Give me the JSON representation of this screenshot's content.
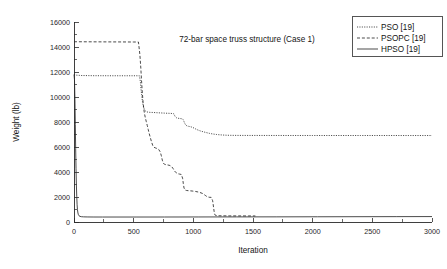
{
  "chart_data": {
    "type": "line",
    "title": "72-bar space truss structure (Case 1)",
    "xlabel": "Iteration",
    "ylabel": "Weight (lb)",
    "xlim": [
      0,
      3000
    ],
    "ylim": [
      0,
      16000
    ],
    "xticks": [
      0,
      500,
      1000,
      1500,
      2000,
      2500,
      3000
    ],
    "yticks": [
      0,
      2000,
      4000,
      6000,
      8000,
      10000,
      12000,
      14000,
      16000
    ],
    "xtick_labels": [
      "0",
      "500",
      "1000",
      "1500",
      "2000",
      "2500",
      "3000"
    ],
    "ytick_labels": [
      "0",
      "2000",
      "4000",
      "6000",
      "8000",
      "10000",
      "12000",
      "14000",
      "16000"
    ],
    "grid": false,
    "legend_position": "top-right",
    "series": [
      {
        "name": "PSO [19]",
        "style": "dash-dot",
        "color": "#2b2b2b",
        "points": [
          [
            0,
            11800
          ],
          [
            8,
            11780
          ],
          [
            20,
            11750
          ],
          [
            60,
            11720
          ],
          [
            160,
            11705
          ],
          [
            300,
            11700
          ],
          [
            430,
            11700
          ],
          [
            520,
            11700
          ],
          [
            548,
            11695
          ],
          [
            556,
            11250
          ],
          [
            562,
            10600
          ],
          [
            568,
            10050
          ],
          [
            574,
            9620
          ],
          [
            580,
            9300
          ],
          [
            588,
            9060
          ],
          [
            596,
            8900
          ],
          [
            606,
            8820
          ],
          [
            620,
            8790
          ],
          [
            640,
            8770
          ],
          [
            668,
            8760
          ],
          [
            700,
            8740
          ],
          [
            740,
            8720
          ],
          [
            780,
            8700
          ],
          [
            812,
            8690
          ],
          [
            836,
            8660
          ],
          [
            848,
            8430
          ],
          [
            860,
            8330
          ],
          [
            872,
            8300
          ],
          [
            888,
            8280
          ],
          [
            902,
            8260
          ],
          [
            916,
            8180
          ],
          [
            926,
            7930
          ],
          [
            936,
            7760
          ],
          [
            948,
            7680
          ],
          [
            962,
            7650
          ],
          [
            978,
            7620
          ],
          [
            996,
            7560
          ],
          [
            1012,
            7480
          ],
          [
            1028,
            7400
          ],
          [
            1046,
            7330
          ],
          [
            1064,
            7270
          ],
          [
            1086,
            7210
          ],
          [
            1110,
            7150
          ],
          [
            1136,
            7090
          ],
          [
            1164,
            7040
          ],
          [
            1196,
            7000
          ],
          [
            1228,
            6970
          ],
          [
            1262,
            6950
          ],
          [
            1300,
            6935
          ],
          [
            1360,
            6928
          ],
          [
            1460,
            6925
          ],
          [
            1700,
            6922
          ],
          [
            2000,
            6920
          ],
          [
            2400,
            6920
          ],
          [
            2800,
            6918
          ],
          [
            3000,
            6918
          ]
        ]
      },
      {
        "name": "PSOPC [19]",
        "style": "dashed",
        "color": "#2b2b2b",
        "points": [
          [
            0,
            14420
          ],
          [
            40,
            14420
          ],
          [
            120,
            14415
          ],
          [
            260,
            14410
          ],
          [
            400,
            14405
          ],
          [
            500,
            14400
          ],
          [
            540,
            14400
          ],
          [
            552,
            13400
          ],
          [
            560,
            12300
          ],
          [
            566,
            11300
          ],
          [
            572,
            10400
          ],
          [
            578,
            9700
          ],
          [
            584,
            9100
          ],
          [
            590,
            8700
          ],
          [
            598,
            8330
          ],
          [
            606,
            8020
          ],
          [
            614,
            7720
          ],
          [
            622,
            7400
          ],
          [
            630,
            7080
          ],
          [
            640,
            6740
          ],
          [
            650,
            6400
          ],
          [
            660,
            6120
          ],
          [
            670,
            5980
          ],
          [
            682,
            5930
          ],
          [
            696,
            5880
          ],
          [
            710,
            5800
          ],
          [
            722,
            5620
          ],
          [
            732,
            5300
          ],
          [
            740,
            4950
          ],
          [
            748,
            4720
          ],
          [
            758,
            4620
          ],
          [
            772,
            4580
          ],
          [
            788,
            4560
          ],
          [
            804,
            4520
          ],
          [
            818,
            4440
          ],
          [
            830,
            4280
          ],
          [
            842,
            4090
          ],
          [
            856,
            3940
          ],
          [
            870,
            3860
          ],
          [
            886,
            3830
          ],
          [
            900,
            3800
          ],
          [
            910,
            3500
          ],
          [
            916,
            3080
          ],
          [
            922,
            2720
          ],
          [
            930,
            2560
          ],
          [
            944,
            2520
          ],
          [
            964,
            2500
          ],
          [
            990,
            2480
          ],
          [
            1020,
            2440
          ],
          [
            1050,
            2380
          ],
          [
            1078,
            2280
          ],
          [
            1100,
            2130
          ],
          [
            1116,
            2020
          ],
          [
            1132,
            1980
          ],
          [
            1150,
            1970
          ],
          [
            1162,
            1700
          ],
          [
            1168,
            1280
          ],
          [
            1174,
            860
          ],
          [
            1180,
            580
          ],
          [
            1190,
            520
          ],
          [
            1210,
            500
          ],
          [
            1250,
            495
          ],
          [
            1300,
            490
          ],
          [
            1380,
            488
          ],
          [
            1460,
            486
          ],
          [
            1520,
            485
          ]
        ]
      },
      {
        "name": "HPSO [19]",
        "style": "solid",
        "color": "#2b2b2b",
        "points": [
          [
            0,
            11800
          ],
          [
            4,
            11400
          ],
          [
            8,
            9800
          ],
          [
            11,
            7800
          ],
          [
            14,
            5900
          ],
          [
            17,
            4300
          ],
          [
            20,
            3000
          ],
          [
            23,
            2050
          ],
          [
            26,
            1380
          ],
          [
            29,
            980
          ],
          [
            33,
            720
          ],
          [
            37,
            580
          ],
          [
            42,
            500
          ],
          [
            50,
            450
          ],
          [
            62,
            425
          ],
          [
            80,
            412
          ],
          [
            110,
            405
          ],
          [
            160,
            400
          ],
          [
            240,
            398
          ],
          [
            360,
            398
          ],
          [
            520,
            398
          ],
          [
            760,
            400
          ],
          [
            1040,
            403
          ],
          [
            1360,
            408
          ],
          [
            1700,
            412
          ],
          [
            2040,
            418
          ],
          [
            2380,
            424
          ],
          [
            2700,
            430
          ],
          [
            3000,
            434
          ]
        ]
      }
    ]
  },
  "legend": {
    "entries": [
      {
        "label": "PSO [19]"
      },
      {
        "label": "PSOPC [19]"
      },
      {
        "label": "HPSO [19]"
      }
    ]
  }
}
